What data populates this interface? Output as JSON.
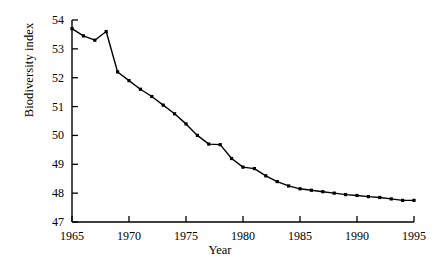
{
  "chart_data": {
    "type": "line",
    "title": "",
    "xlabel": "Year",
    "ylabel": "Biodiversity index",
    "xlim": [
      1965,
      1995
    ],
    "ylim": [
      47,
      54
    ],
    "grid": false,
    "legend": null,
    "marker": "filled-square",
    "line_color": "#000000",
    "marker_color": "#000000",
    "xticks": [
      1965,
      1970,
      1975,
      1980,
      1985,
      1990,
      1995
    ],
    "xtick_labels": [
      "1965",
      "1970",
      "1975",
      "1980",
      "1985",
      "1990",
      "1995"
    ],
    "yticks": [
      47,
      48,
      49,
      50,
      51,
      52,
      53,
      54
    ],
    "ytick_labels": [
      "47",
      "48",
      "49",
      "50",
      "51",
      "52",
      "53",
      "54"
    ],
    "x": [
      1965,
      1966,
      1967,
      1968,
      1969,
      1970,
      1971,
      1972,
      1973,
      1974,
      1975,
      1976,
      1977,
      1978,
      1979,
      1980,
      1981,
      1982,
      1983,
      1984,
      1985,
      1986,
      1987,
      1988,
      1989,
      1990,
      1991,
      1992,
      1993,
      1994,
      1995
    ],
    "values": [
      53.7,
      53.45,
      53.3,
      53.6,
      52.2,
      51.9,
      51.6,
      51.35,
      51.05,
      50.75,
      50.4,
      50.0,
      49.7,
      49.68,
      49.2,
      48.9,
      48.85,
      48.6,
      48.4,
      48.25,
      48.15,
      48.1,
      48.05,
      48.0,
      47.95,
      47.92,
      47.88,
      47.85,
      47.8,
      47.75,
      47.75
    ],
    "series": [
      {
        "name": "Biodiversity index",
        "values": [
          53.7,
          53.45,
          53.3,
          53.6,
          52.2,
          51.9,
          51.6,
          51.35,
          51.05,
          50.75,
          50.4,
          50.0,
          49.7,
          49.68,
          49.2,
          48.9,
          48.85,
          48.6,
          48.4,
          48.25,
          48.15,
          48.1,
          48.05,
          48.0,
          47.95,
          47.92,
          47.88,
          47.85,
          47.8,
          47.75,
          47.75
        ]
      }
    ]
  }
}
